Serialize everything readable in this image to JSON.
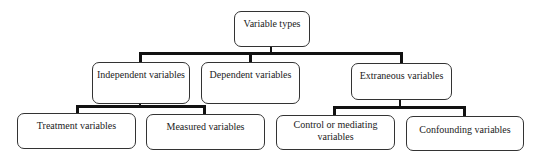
{
  "diagram": {
    "root": {
      "label": "Variable types"
    },
    "level1": [
      {
        "label": "Independent variables"
      },
      {
        "label": "Dependent variables"
      },
      {
        "label": "Extraneous variables"
      }
    ],
    "level2": {
      "independent": [
        {
          "label": "Treatment variables"
        },
        {
          "label": "Measured variables"
        }
      ],
      "extraneous": [
        {
          "label": "Control or mediating variables"
        },
        {
          "label": "Confounding variables"
        }
      ]
    }
  }
}
